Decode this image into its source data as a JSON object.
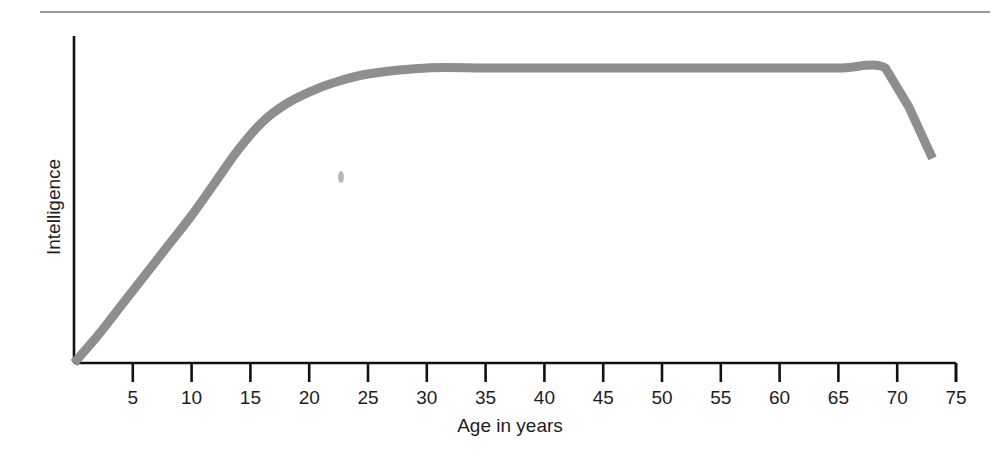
{
  "figure": {
    "top_rule": "horizontal-rule",
    "background_color": "#ffffff",
    "curve_color": "#8e8e8e",
    "axis_color": "#111111"
  },
  "chart_data": {
    "type": "line",
    "title": "",
    "subtitle": "",
    "xlabel": "Age in years",
    "ylabel": "Intelligence",
    "xlim": [
      0,
      75
    ],
    "ylim": [
      0,
      100
    ],
    "grid": false,
    "legend": false,
    "legend_position": "none",
    "xticks": [
      5,
      10,
      15,
      20,
      25,
      30,
      35,
      40,
      45,
      50,
      55,
      60,
      65,
      70,
      75
    ],
    "xtick_labels": [
      "5",
      "10",
      "15",
      "20",
      "25",
      "30",
      "35",
      "40",
      "45",
      "50",
      "55",
      "60",
      "65",
      "70",
      "75"
    ],
    "yticks": [],
    "ytick_labels": [],
    "series": [
      {
        "name": "Intelligence",
        "color": "#8e8e8e",
        "x": [
          0,
          2,
          4,
          6,
          8,
          10,
          12,
          14,
          16,
          18,
          20,
          22,
          25,
          30,
          35,
          40,
          45,
          50,
          55,
          60,
          65,
          69,
          71,
          73
        ],
        "y": [
          0,
          9,
          19,
          29,
          39,
          49,
          60,
          71,
          80,
          86,
          90,
          93,
          96,
          98,
          98,
          98,
          98,
          98,
          98,
          98,
          98,
          98,
          85,
          68
        ]
      }
    ],
    "annotations": [
      {
        "name": "scan-speck",
        "x": 22.7,
        "y": 63,
        "text": ""
      }
    ]
  },
  "axes": {
    "x_axis_title": "Age in years",
    "y_axis_title": "Intelligence"
  }
}
